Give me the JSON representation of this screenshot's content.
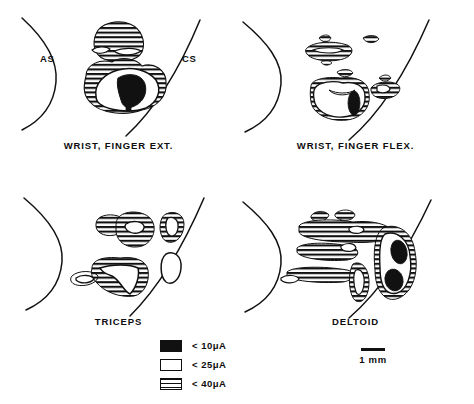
{
  "figure": {
    "type": "anatomical-diagram",
    "panels": [
      {
        "id": "wrist-finger-ext",
        "title": "WRIST, FINGER EXT.",
        "sulcus_labels": {
          "anterior": "AS",
          "posterior": "CS"
        }
      },
      {
        "id": "wrist-finger-flex",
        "title": "WRIST, FINGER FLEX.",
        "sulcus_labels": {
          "anterior": "",
          "posterior": ""
        }
      },
      {
        "id": "triceps",
        "title": "TRICEPS",
        "sulcus_labels": {
          "anterior": "",
          "posterior": ""
        }
      },
      {
        "id": "deltoid",
        "title": "DELTOID",
        "sulcus_labels": {
          "anterior": "",
          "posterior": ""
        }
      }
    ]
  },
  "legend": {
    "items": [
      {
        "swatch": "solid-black",
        "label": "< 10μA"
      },
      {
        "swatch": "open-white",
        "label": "< 25μA"
      },
      {
        "swatch": "hatched",
        "label": "< 40μA"
      }
    ]
  },
  "scalebar": {
    "label": "1 mm"
  },
  "colors": {
    "ink": "#111111",
    "paper": "#ffffff"
  }
}
